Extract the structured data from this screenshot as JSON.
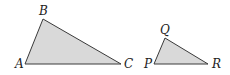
{
  "figure": {
    "colors": {
      "fill": "#d9d9d9",
      "stroke": "#3a3a3a",
      "label": "#222222",
      "background": "#ffffff"
    },
    "triangles": [
      {
        "name": "triangle-abc",
        "vertices": [
          {
            "label": "A",
            "x": 25,
            "y": 64,
            "lx": 15,
            "ly": 68
          },
          {
            "label": "B",
            "x": 43,
            "y": 19,
            "lx": 39,
            "ly": 15
          },
          {
            "label": "C",
            "x": 121,
            "y": 64,
            "lx": 124,
            "ly": 68
          }
        ]
      },
      {
        "name": "triangle-pqr",
        "vertices": [
          {
            "label": "P",
            "x": 154,
            "y": 64,
            "lx": 144,
            "ly": 68
          },
          {
            "label": "Q",
            "x": 165,
            "y": 38,
            "lx": 160,
            "ly": 34
          },
          {
            "label": "R",
            "x": 208,
            "y": 64,
            "lx": 212,
            "ly": 68
          }
        ]
      }
    ]
  }
}
